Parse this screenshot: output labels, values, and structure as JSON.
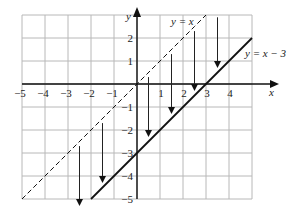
{
  "chart_data": {
    "type": "line",
    "title": "",
    "xlabel": "x",
    "ylabel": "y",
    "xlim": [
      -5,
      5
    ],
    "ylim": [
      -5,
      3
    ],
    "grid": true,
    "x_ticks": [
      "-5",
      "-4",
      "-3",
      "-2",
      "-1",
      "1",
      "2",
      "3",
      "4"
    ],
    "y_ticks": [
      "2",
      "1",
      "-1",
      "-2",
      "-3",
      "-4",
      "-5"
    ],
    "series": [
      {
        "name": "y = x",
        "style": "dashed",
        "points": [
          [
            -5,
            -5
          ],
          [
            2.5,
            2.5
          ],
          [
            3,
            3
          ]
        ]
      },
      {
        "name": "y = x − 3",
        "style": "solid",
        "points": [
          [
            -2,
            -5
          ],
          [
            5,
            2
          ]
        ]
      }
    ],
    "arrows": [
      {
        "x": -2.5,
        "from": -2.7,
        "to": -5.3
      },
      {
        "x": -1.5,
        "from": -1.7,
        "to": -4.3
      },
      {
        "x": 0.5,
        "from": 0.3,
        "to": -2.3
      },
      {
        "x": 1.5,
        "from": 1.3,
        "to": -1.3
      },
      {
        "x": 2.5,
        "from": 2.3,
        "to": -0.3
      },
      {
        "x": 3.5,
        "from": 2.9,
        "to": 0.7
      }
    ],
    "annotations": [
      "y = x",
      "y = x − 3"
    ]
  },
  "labels": {
    "x_axis": "x",
    "y_axis": "y",
    "line1": "y = x",
    "line2": "y = x − 3"
  }
}
